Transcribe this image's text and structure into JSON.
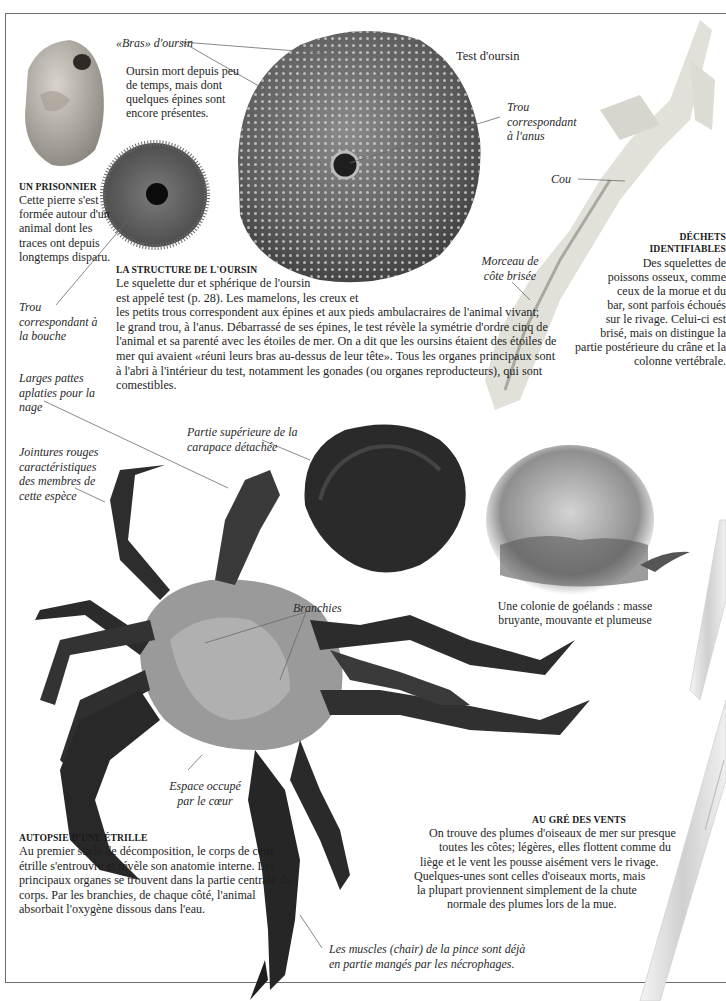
{
  "page": {
    "border_color": "#6e6e6e",
    "background": "#ffffff"
  },
  "urchin": {
    "arms_label": "«Bras» d'oursin",
    "dead_urchin_note": [
      "Oursin mort depuis peu",
      "de temps, mais dont",
      "quelques épines sont",
      "encore présentes."
    ],
    "test_label": "Test d'oursin",
    "anus_label": [
      "Trou",
      "correspondant",
      "à l'anus"
    ],
    "mouth_label": [
      "Trou",
      "correspondant à",
      "la bouche"
    ],
    "structure_heading": "LA STRUCTURE DE L'OURSIN",
    "structure_text": [
      "Le squelette dur et sphérique de l'oursin",
      "est appelé test (p. 28). Les mamelons, les creux et",
      "les petits trous correspondent aux épines et aux pieds ambulacraires de l'animal vivant;",
      "le grand trou, à l'anus. Débarrassé de ses épines, le test révèle la symétrie d'ordre cinq de",
      "l'animal et sa parenté avec les étoiles de mer. On a dit que les oursins étaient des étoiles de",
      "mer qui avaient «réuni leurs bras au-dessus de leur tête». Tous les organes principaux sont",
      "à l'abri à l'intérieur du test, notamment les gonades (ou organes reproducteurs), qui sont",
      "comestibles."
    ]
  },
  "prisoner": {
    "heading": "UN PRISONNIER",
    "text": [
      "Cette pierre s'est",
      "formée autour d'un",
      "animal dont les",
      "traces ont depuis",
      "longtemps disparu."
    ]
  },
  "fish": {
    "neck_label": "Cou",
    "rib_label": [
      "Morceau de",
      "côte brisée"
    ],
    "heading": [
      "DÉCHETS",
      "IDENTIFIABLES"
    ],
    "text": [
      "Des squelettes de",
      "poissons osseux, comme",
      "ceux de la morue et du",
      "bar, sont parfois échoués",
      "sur le rivage. Celui-ci est",
      "brisé, mais on distingue la",
      "partie postérieure du crâne et la",
      "colonne vertébrale."
    ]
  },
  "crab": {
    "paddle_label": [
      "Larges pattes",
      "aplaties pour la",
      "nage"
    ],
    "joints_label": [
      "Jointures rouges",
      "caractéristiques",
      "des membres de",
      "cette espèce"
    ],
    "carapace_label": [
      "Partie supérieure de la",
      "carapace détachée"
    ],
    "gills_label": "Branchies",
    "heart_label": [
      "Espace occupé",
      "par le cœur"
    ],
    "muscles_label": [
      "Les muscles (chair) de la pince sont déjà",
      "en partie mangés par les nécrophages."
    ],
    "heading": "AUTOPSIE D'UNE ÉTRILLE",
    "text": [
      "Au premier stade de décomposition, le corps de cette",
      "étrille s'entrouvre et révèle son anatomie interne. Les",
      "principaux organes se trouvent dans la partie centrale du",
      "corps. Par les branchies, de chaque côté, l'animal",
      "absorbait l'oxygène dissous dans l'eau."
    ]
  },
  "gulls": {
    "caption": [
      "Une colonie de goélands : masse",
      "bruyante, mouvante et plumeuse"
    ]
  },
  "feathers": {
    "heading": "AU GRÉ DES VENTS",
    "text": [
      "On trouve des plumes d'oiseaux de mer sur presque",
      "toutes les côtes; légères, elles flottent comme du",
      "liège et le vent les pousse aisément vers le rivage.",
      "Quelques-unes sont celles d'oiseaux morts, mais",
      "la plupart proviennent simplement de la chute",
      "normale des plumes lors de la mue."
    ]
  }
}
